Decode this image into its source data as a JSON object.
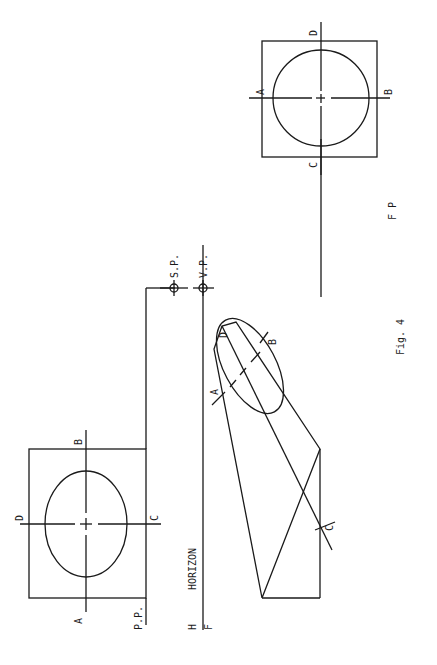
{
  "figure": {
    "caption": "Fig. 4",
    "colors": {
      "ink": "#1a1a1a",
      "paper": "#ffffff"
    }
  },
  "left_square": {
    "labels": {
      "a": "A",
      "b": "B",
      "c": "C",
      "d": "D"
    },
    "picture_plane": "P.P."
  },
  "horizon": {
    "h_label": "H",
    "f_label": "F",
    "text": "HORIZON"
  },
  "points": {
    "station_point": "S.P.",
    "vanishing_point": "V.P."
  },
  "perspective_view": {
    "labels": {
      "a": "A",
      "b": "B",
      "c": "C",
      "d": "D"
    }
  },
  "right_square": {
    "labels": {
      "a": "A",
      "b": "B",
      "c": "C",
      "d": "D"
    },
    "ground_line": {
      "f": "F",
      "p": "P"
    }
  }
}
